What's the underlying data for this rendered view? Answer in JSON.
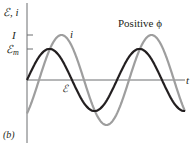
{
  "figure": {
    "panel_label": "(b)",
    "y_axis_label": "ℰ, i",
    "x_axis_label": "t",
    "annotation": "Positive ϕ",
    "tick_labels": {
      "I": "I",
      "Em": "ℰ",
      "Em_sub": "m"
    },
    "curve_labels": {
      "current": "i",
      "emf": "ℰ"
    },
    "colors": {
      "emf": "#231f20",
      "current": "#9e9e9e",
      "axis": "#6d6e70"
    }
  },
  "chart_data": {
    "type": "line",
    "title": "Positive ϕ",
    "xlabel": "t",
    "ylabel": "ℰ, i",
    "grid": false,
    "series": [
      {
        "name": "ℰ",
        "color": "#231f20",
        "form": "sine",
        "amplitude_label": "ℰm",
        "relative_amplitude": 0.69,
        "phase_deg": 0
      },
      {
        "name": "i",
        "color": "#9e9e9e",
        "form": "sine",
        "amplitude_label": "I",
        "relative_amplitude": 1.0,
        "phase_deg": -48
      }
    ],
    "cycles_shown": 1.75
  }
}
